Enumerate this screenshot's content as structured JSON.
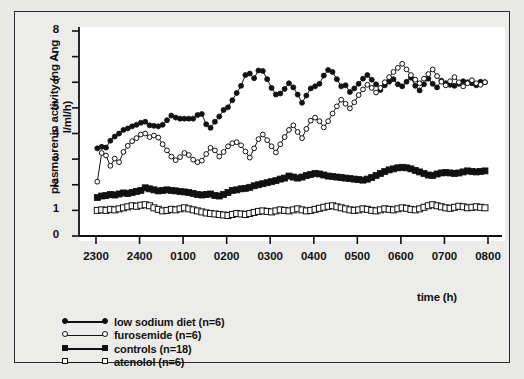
{
  "chart_data": {
    "type": "line",
    "title": "",
    "xlabel": "time (h)",
    "ylabel": "plasma renin activity (ng Ang I/ml/h)",
    "ylim": [
      0,
      8
    ],
    "yticks": [
      0,
      1,
      2,
      3,
      4,
      5,
      6,
      7,
      8
    ],
    "ytick_labels": [
      "0",
      "1",
      "2",
      "3",
      "4",
      "5",
      "6",
      "7",
      "8"
    ],
    "xticks": [
      2300,
      2400,
      100,
      200,
      300,
      400,
      500,
      600,
      700,
      800
    ],
    "xtick_labels": [
      "2300",
      "2400",
      "0100",
      "0200",
      "0300",
      "0400",
      "0500",
      "0600",
      "0700",
      "0800"
    ],
    "xlim_hours": [
      -0.15,
      9.0
    ],
    "grid": false,
    "legend_position": "below-left",
    "x_sample_interval_hours": 0.1,
    "x_start_hour": 0.03,
    "series": [
      {
        "name": "low sodium diet (n=6)",
        "marker": "filled-circle",
        "color": "#111111",
        "values": [
          3.42,
          3.48,
          3.45,
          3.72,
          3.88,
          4.0,
          4.14,
          4.2,
          4.28,
          4.34,
          4.42,
          4.46,
          4.32,
          4.3,
          4.28,
          4.34,
          4.52,
          4.7,
          4.62,
          4.58,
          4.58,
          4.58,
          4.58,
          4.72,
          4.76,
          4.36,
          4.22,
          4.46,
          4.66,
          4.92,
          5.02,
          5.3,
          5.58,
          5.86,
          6.28,
          6.34,
          6.16,
          6.46,
          6.44,
          6.12,
          5.78,
          5.52,
          5.56,
          5.74,
          5.96,
          5.8,
          5.52,
          5.2,
          5.48,
          5.76,
          5.84,
          5.94,
          6.26,
          6.48,
          6.4,
          6.12,
          5.84,
          5.88,
          5.62,
          5.76,
          5.94,
          6.14,
          6.28,
          6.1,
          5.92,
          5.7,
          5.88,
          6.02,
          6.12,
          5.92,
          5.84,
          6.02,
          6.18,
          5.86,
          5.68,
          5.92,
          6.14,
          5.94,
          5.8,
          6.06,
          5.96,
          5.9,
          5.86,
          5.94,
          6.04,
          6.0,
          5.96,
          5.88,
          6.02,
          6.0
        ]
      },
      {
        "name": "furosemide (n=6)",
        "marker": "open-circle",
        "color": "#111111",
        "values": [
          2.12,
          3.24,
          3.14,
          2.74,
          3.02,
          2.88,
          3.28,
          3.52,
          3.7,
          3.82,
          3.96,
          4.0,
          3.86,
          3.92,
          3.84,
          3.58,
          3.34,
          3.1,
          2.96,
          3.08,
          3.24,
          3.16,
          2.98,
          2.88,
          2.94,
          3.2,
          3.44,
          3.34,
          3.1,
          3.28,
          3.5,
          3.62,
          3.66,
          3.54,
          3.3,
          3.06,
          3.42,
          3.78,
          3.96,
          3.74,
          3.5,
          3.26,
          3.58,
          3.86,
          4.14,
          4.32,
          4.06,
          3.82,
          4.18,
          4.5,
          4.62,
          4.48,
          4.24,
          4.48,
          4.78,
          5.06,
          5.32,
          5.16,
          4.98,
          5.22,
          5.5,
          5.72,
          5.9,
          5.78,
          5.6,
          5.78,
          6.0,
          6.2,
          6.4,
          6.56,
          6.72,
          6.5,
          6.28,
          6.1,
          5.96,
          6.14,
          6.32,
          6.5,
          6.24,
          6.02,
          5.88,
          6.04,
          6.2,
          6.0,
          5.84,
          5.96,
          6.08,
          5.96,
          5.9,
          6.0
        ]
      },
      {
        "name": "controls (n=18)",
        "marker": "filled-square",
        "color": "#111111",
        "values": [
          1.5,
          1.56,
          1.58,
          1.62,
          1.6,
          1.64,
          1.68,
          1.66,
          1.7,
          1.74,
          1.78,
          1.88,
          1.84,
          1.8,
          1.76,
          1.78,
          1.8,
          1.78,
          1.76,
          1.74,
          1.72,
          1.7,
          1.66,
          1.62,
          1.6,
          1.62,
          1.64,
          1.58,
          1.56,
          1.62,
          1.7,
          1.78,
          1.8,
          1.84,
          1.86,
          1.9,
          1.96,
          2.0,
          2.04,
          2.08,
          2.12,
          2.16,
          2.22,
          2.26,
          2.34,
          2.3,
          2.26,
          2.3,
          2.36,
          2.4,
          2.44,
          2.42,
          2.38,
          2.34,
          2.32,
          2.3,
          2.28,
          2.26,
          2.24,
          2.22,
          2.2,
          2.18,
          2.22,
          2.28,
          2.36,
          2.44,
          2.52,
          2.58,
          2.62,
          2.66,
          2.68,
          2.66,
          2.62,
          2.56,
          2.5,
          2.44,
          2.38,
          2.36,
          2.42,
          2.46,
          2.48,
          2.46,
          2.44,
          2.46,
          2.5,
          2.54,
          2.52,
          2.5,
          2.52,
          2.54
        ]
      },
      {
        "name": "atenolol (n=6)",
        "marker": "open-square",
        "color": "#111111",
        "values": [
          1.0,
          1.02,
          1.0,
          1.04,
          1.02,
          1.06,
          1.1,
          1.14,
          1.18,
          1.16,
          1.2,
          1.22,
          1.18,
          1.1,
          1.04,
          0.98,
          1.0,
          1.04,
          1.02,
          1.06,
          1.1,
          1.06,
          1.02,
          0.98,
          0.94,
          0.9,
          0.88,
          0.86,
          0.84,
          0.82,
          0.8,
          0.84,
          0.88,
          0.86,
          0.84,
          0.88,
          0.92,
          0.96,
          0.98,
          0.96,
          0.94,
          0.98,
          1.02,
          1.0,
          0.98,
          1.02,
          1.06,
          1.02,
          0.98,
          1.0,
          1.04,
          1.08,
          1.12,
          1.16,
          1.18,
          1.14,
          1.1,
          1.06,
          1.02,
          1.0,
          1.02,
          1.06,
          1.04,
          1.0,
          0.98,
          1.02,
          1.06,
          1.04,
          1.02,
          1.06,
          1.1,
          1.08,
          1.04,
          1.02,
          1.06,
          1.12,
          1.18,
          1.22,
          1.18,
          1.14,
          1.1,
          1.08,
          1.12,
          1.16,
          1.14,
          1.1,
          1.12,
          1.14,
          1.12,
          1.1
        ]
      }
    ]
  }
}
